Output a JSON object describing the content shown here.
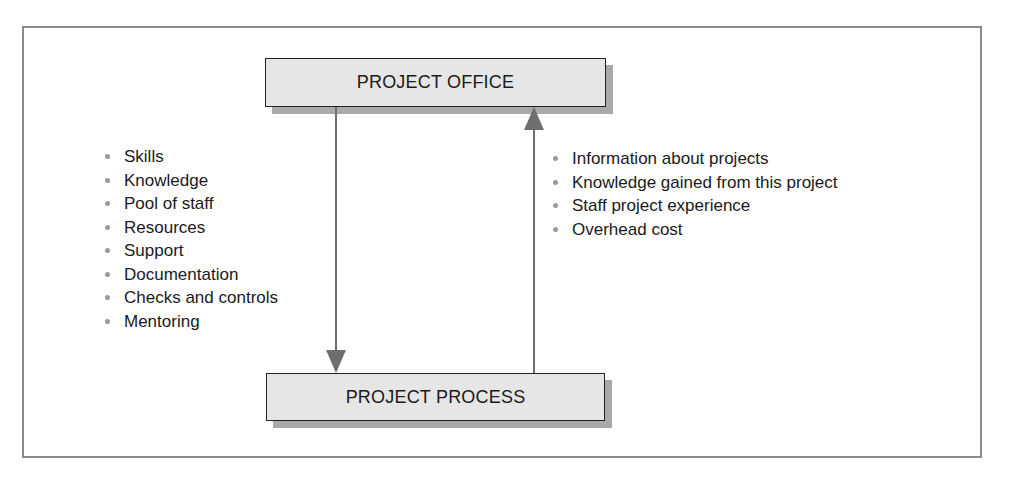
{
  "diagram": {
    "top_box": {
      "label": "PROJECT OFFICE"
    },
    "bottom_box": {
      "label": "PROJECT PROCESS"
    },
    "arrows": [
      {
        "from": "PROJECT OFFICE",
        "to": "PROJECT PROCESS",
        "direction": "down"
      },
      {
        "from": "PROJECT PROCESS",
        "to": "PROJECT OFFICE",
        "direction": "up"
      }
    ],
    "left_list": {
      "items": [
        "Skills",
        "Knowledge",
        "Pool of staff",
        "Resources",
        "Support",
        "Documentation",
        "Checks and controls",
        "Mentoring"
      ]
    },
    "right_list": {
      "items": [
        "Information about projects",
        "Knowledge gained from this project",
        "Staff project experience",
        "Overhead cost"
      ]
    },
    "colors": {
      "box_fill": "#e6e6e6",
      "box_shadow": "#a9a9a9",
      "arrow": "#6e6e6e",
      "frame": "#8a8a8a",
      "bullet": "#9a9a9a"
    }
  }
}
